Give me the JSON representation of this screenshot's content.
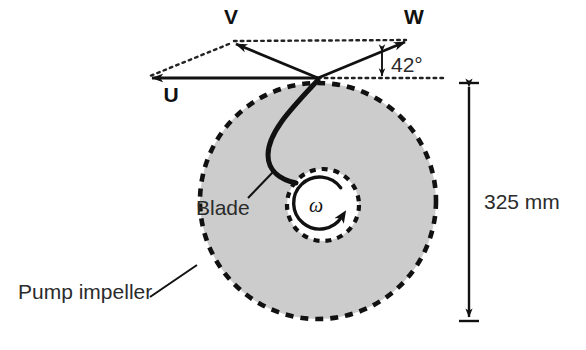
{
  "figure": {
    "background_color": "#ffffff"
  },
  "colors": {
    "stroke": "#111111",
    "impeller_fill": "#cccccc",
    "impeller_edge": "#111111",
    "hub_fill": "#ffffff",
    "text": "#1a1a1a",
    "dotted": "#222222"
  },
  "vectors": [
    {
      "name": "U",
      "label": "U",
      "label_x": 171,
      "label_y": 102,
      "from_x": 318,
      "from_y": 78,
      "to_x": 148,
      "to_y": 78,
      "style": "solid",
      "description": "blade tip speed, points left"
    },
    {
      "name": "V",
      "label": "V",
      "label_x": 231,
      "label_y": 24,
      "from_x": 318,
      "from_y": 78,
      "to_x": 231,
      "to_y": 42,
      "style": "solid",
      "description": "absolute velocity, points up-left"
    },
    {
      "name": "W",
      "label": "W",
      "label_x": 414,
      "label_y": 24,
      "from_x": 318,
      "from_y": 78,
      "to_x": 409,
      "to_y": 40,
      "style": "solid",
      "description": "relative velocity, points up-right"
    }
  ],
  "construction_lines": [
    {
      "name": "dotted-v-to-w",
      "from_x": 234,
      "from_y": 41,
      "to_x": 406,
      "to_y": 40,
      "style": "dotted"
    },
    {
      "name": "dotted-v-to-u",
      "from_x": 229,
      "from_y": 43,
      "to_x": 150,
      "to_y": 76,
      "style": "dotted"
    },
    {
      "name": "dotted-horizontal-angle-base",
      "from_x": 318,
      "from_y": 78,
      "to_x": 443,
      "to_y": 78,
      "style": "dotted"
    }
  ],
  "angle": {
    "label": "42°",
    "value": 42,
    "unit": "degrees",
    "label_x": 396,
    "label_y": 78,
    "indicator_x": 382,
    "indicator_top_y": 50,
    "indicator_bottom_y": 77,
    "description": "angle between W vector and horizontal"
  },
  "impeller": {
    "label": "Pump impeller",
    "label_x": 18,
    "label_y": 298,
    "center_x": 318,
    "center_y": 201,
    "radius": 118,
    "edge_style": "dashed",
    "fill": "#cccccc",
    "leader": {
      "from_x": 150,
      "from_y": 296,
      "to_x": 196,
      "to_y": 266
    }
  },
  "hub": {
    "center_x": 323,
    "center_y": 205,
    "radius": 36,
    "edge_style": "dashed",
    "fill": "#ffffff"
  },
  "rotation": {
    "symbol": "ω",
    "symbol_x": 316,
    "symbol_y": 212,
    "direction": "counterclockwise",
    "arrow_radius": 26,
    "description": "angular velocity of impeller"
  },
  "blade": {
    "label": "Blade",
    "label_x": 196,
    "label_y": 214,
    "leader": {
      "from_x": 248,
      "from_y": 198,
      "to_x": 273,
      "to_y": 172
    },
    "path_start_x": 318,
    "path_start_y": 80,
    "path_end_x": 295,
    "path_end_y": 182,
    "description": "curved impeller blade from rim to hub"
  },
  "dimension": {
    "label": "325 mm",
    "value": 325,
    "unit": "mm",
    "label_x": 475,
    "label_y": 207,
    "line_x": 469,
    "top_y": 83,
    "bottom_y": 321,
    "tick_half_width": 10,
    "description": "impeller outer diameter"
  }
}
